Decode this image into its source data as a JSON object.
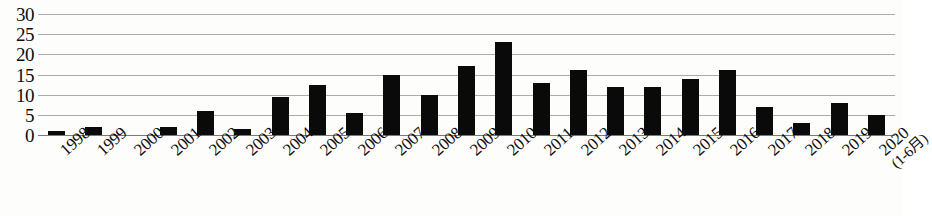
{
  "chart_data": {
    "type": "bar",
    "title": "",
    "subtitle": "",
    "xlabel": "",
    "ylabel": "",
    "ylim": [
      0,
      30
    ],
    "ytick_labels": [
      "30",
      "25",
      "20",
      "15",
      "10",
      "5",
      "0"
    ],
    "ytick_values": [
      30,
      25,
      20,
      15,
      10,
      5,
      0
    ],
    "grid": true,
    "legend": null,
    "legend_position": "none",
    "bar_color": "#0a0a0a",
    "gridline_color": "#8a8a8a",
    "background_color": "#fdfdfb",
    "categories": [
      "1998",
      "1999",
      "2000",
      "2001",
      "2002",
      "2003",
      "2004",
      "2005",
      "2006",
      "2007",
      "2008",
      "2009",
      "2010",
      "2011",
      "2012",
      "2013",
      "2014",
      "2015",
      "2016",
      "2017",
      "2018",
      "2019",
      "2020"
    ],
    "category_sublabels": [
      "",
      "",
      "",
      "",
      "",
      "",
      "",
      "",
      "",
      "",
      "",
      "",
      "",
      "",
      "",
      "",
      "",
      "",
      "",
      "",
      "",
      "",
      "(1-6月)"
    ],
    "values": [
      1,
      2,
      0,
      2,
      6,
      1.5,
      9.5,
      12.5,
      5.5,
      15,
      10,
      17,
      23,
      13,
      16,
      12,
      12,
      14,
      16,
      7,
      3,
      8,
      5
    ]
  }
}
